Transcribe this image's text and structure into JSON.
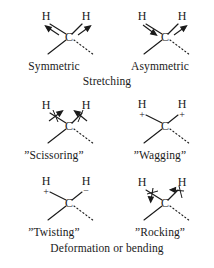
{
  "figure": {
    "title_stretching": "Stretching",
    "title_deformation": "Deformation or bending",
    "background_color": "#ffffff",
    "ink_color": "#1a1a1a"
  },
  "atoms": {
    "hydrogen": "H",
    "carbon": "C",
    "plus": "+",
    "minus": "−"
  },
  "modes": [
    {
      "id": "symmetric-stretch",
      "label": "Symmetric",
      "row": 0,
      "col": 0,
      "group": "stretching",
      "left_h": "H",
      "right_h": "C",
      "center": "C",
      "annotation_left": "arrow-out-up-left",
      "annotation_right": "arrow-out-up-right",
      "signs": []
    },
    {
      "id": "asymmetric-stretch",
      "label": "Asymmetric",
      "row": 0,
      "col": 1,
      "group": "stretching",
      "center": "C",
      "annotation_left": "arrow-in-down-right",
      "annotation_right": "arrow-out-up-right",
      "signs": []
    },
    {
      "id": "scissoring",
      "label": "”Scissoring”",
      "row": 1,
      "col": 0,
      "group": "deformation",
      "center": "C",
      "annotation_left": "arrow-in-up-right-ticked",
      "annotation_right": "arrow-in-up-left-ticked",
      "signs": []
    },
    {
      "id": "wagging",
      "label": "”Wagging”",
      "row": 1,
      "col": 1,
      "group": "deformation",
      "center": "C",
      "annotation_left": "sign-plus",
      "annotation_right": "sign-plus",
      "signs": [
        "+",
        "+"
      ]
    },
    {
      "id": "twisting",
      "label": "”Twisting”",
      "row": 2,
      "col": 0,
      "group": "deformation",
      "center": "C",
      "annotation_left": "sign-plus",
      "annotation_right": "sign-minus",
      "signs": [
        "+",
        "−"
      ]
    },
    {
      "id": "rocking",
      "label": "”Rocking”",
      "row": 2,
      "col": 1,
      "group": "deformation",
      "center": "C",
      "annotation_left": "arrow-down-left-ticked",
      "annotation_right": "arrow-left-ticked",
      "signs": []
    }
  ],
  "labels": {
    "symmetric": "Symmetric",
    "asymmetric": "Asymmetric",
    "scissoring": "”Scissoring”",
    "wagging": "”Wagging”",
    "twisting": "”Twisting”",
    "rocking": "”Rocking”",
    "stretching": "Stretching",
    "deformation": "Deformation or bending"
  }
}
